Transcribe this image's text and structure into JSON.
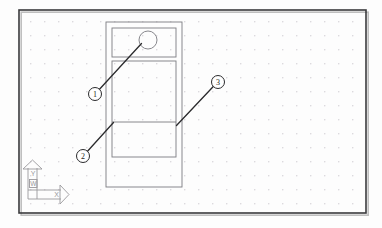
{
  "app": {
    "type": "cad-drawing-viewport",
    "title": "AutoCAD model space viewport"
  },
  "canvas": {
    "width": 382,
    "height": 228,
    "background_color": "#fdfdfd",
    "border": {
      "x": 19,
      "y": 10,
      "width": 347,
      "height": 203,
      "color": "#3a3a3c",
      "stroke_width": 1.6,
      "shadow_color": "#bfbfbf"
    },
    "grid": {
      "enabled": true,
      "type": "dots",
      "spacing": 14,
      "origin_x": 30,
      "origin_y": 21,
      "dot_color": "#d4d2d6",
      "dot_radius": 0.75
    }
  },
  "drawing": {
    "line_color": "#7b7b80",
    "line_width": 0.9,
    "outer_rect": {
      "x": 106,
      "y": 22,
      "width": 76,
      "height": 165,
      "label": "door-panel-outline"
    },
    "inner_rects": [
      {
        "x": 112,
        "y": 28,
        "width": 64,
        "height": 29,
        "label": "upper-glazing-panel"
      },
      {
        "x": 112,
        "y": 61,
        "width": 64,
        "height": 96,
        "label": "lower-panel"
      }
    ],
    "divider_lines": [
      {
        "x1": 112,
        "y1": 122,
        "x2": 176,
        "y2": 122,
        "label": "mid-rail-line"
      }
    ],
    "circle": {
      "cx": 148,
      "cy": 40,
      "r": 9,
      "label": "knob-circle"
    }
  },
  "callouts": [
    {
      "id": "1",
      "label": "1",
      "bubble": {
        "cx": 95,
        "cy": 94,
        "r": 6.5
      },
      "leader": {
        "x1": 99.5,
        "y1": 89.3,
        "x2": 141.5,
        "y2": 43.5
      },
      "name": "callout-bubble-1"
    },
    {
      "id": "2",
      "label": "2",
      "bubble": {
        "cx": 83,
        "cy": 156,
        "r": 6.5
      },
      "leader": {
        "x1": 87.5,
        "y1": 151.3,
        "x2": 113.5,
        "y2": 122.5
      },
      "name": "callout-bubble-2"
    },
    {
      "id": "3",
      "label": "3",
      "bubble": {
        "cx": 218,
        "cy": 82,
        "r": 6.5
      },
      "leader": {
        "x1": 213.3,
        "y1": 86.5,
        "x2": 176.5,
        "y2": 125.5
      },
      "name": "callout-bubble-3"
    }
  ],
  "callout_style": {
    "stroke_color": "#2b2b2d",
    "leader_width": 1.3,
    "bubble_width": 1.0,
    "text_color": "#1f1f20",
    "font_size": 8
  },
  "ucs_icon": {
    "name": "ucs-world-coordinate-icon",
    "stroke_color": "#9a989c",
    "stroke_width": 0.9,
    "origin": {
      "x": 28,
      "y": 199
    },
    "axis_labels": {
      "y": "Y",
      "x": "X",
      "world": "W"
    },
    "y_axis_length": 31,
    "x_axis_length": 33,
    "label_font_size": 7
  }
}
